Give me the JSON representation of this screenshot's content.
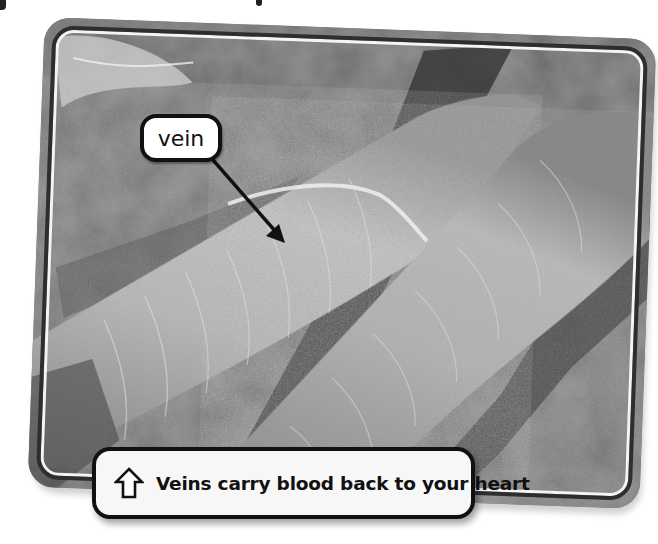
{
  "figure": {
    "style": "grayscale photo in rounded frame",
    "colors": {
      "frame_outline": "#2e2e2e",
      "label_border": "#111111",
      "label_fill": "#ffffff",
      "caption_fill": "#f7f7f7",
      "text": "#111111"
    }
  },
  "callout": {
    "label": "vein",
    "pointer": "arrow-down-right"
  },
  "caption": {
    "icon": "up-arrow-outline-icon",
    "text": "Veins carry blood back to your heart"
  }
}
